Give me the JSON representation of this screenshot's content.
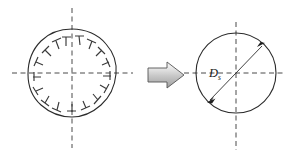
{
  "figure": {
    "background_color": "#ffffff",
    "width": 287,
    "height": 156
  },
  "left_shape": {
    "name": "deformed-hole",
    "description": "Irregular out-of-round hole outline with inward radial hook marks",
    "center": {
      "x": 72,
      "y": 73
    },
    "radius": 44,
    "outline_color": "#2b2b2b",
    "tick_color": "#3a3a3a",
    "tick_count": 14,
    "tick_angles_deg": [
      100,
      78,
      56,
      34,
      12,
      -10,
      -32,
      -54,
      -76,
      -98,
      -120,
      -142,
      -164,
      174
    ],
    "axes": {
      "horizontal": {
        "x1": 12,
        "y1": 73,
        "x2": 133,
        "y2": 73
      },
      "vertical": {
        "x1": 72,
        "y1": 8,
        "x2": 72,
        "y2": 148
      },
      "color": "#4a4a4a",
      "style": "dashed"
    }
  },
  "transform_arrow": {
    "name": "block-arrow",
    "direction": "right",
    "fill_light": "#f2f2f2",
    "fill_mid": "#c9c9c9",
    "fill_dark": "#9a9a9a",
    "outline_color": "#555555",
    "x": 148,
    "y": 62,
    "width": 36,
    "height": 26
  },
  "right_shape": {
    "name": "nominal-hole",
    "description": "Ideal circular hole with diameter dimension",
    "center": {
      "x": 236,
      "y": 73
    },
    "radius": 40,
    "outline_color": "#2b2b2b",
    "axes": {
      "horizontal": {
        "x1": 184,
        "y1": 73,
        "x2": 285,
        "y2": 73
      },
      "vertical": {
        "x1": 236,
        "y1": 22,
        "x2": 236,
        "y2": 150
      },
      "color": "#4a4a4a",
      "style": "dashed"
    },
    "dimension": {
      "label": "D",
      "subscript": "s",
      "label_color": "#1a1a1a",
      "line_color": "#2b2b2b",
      "start": {
        "x": 208,
        "y": 102
      },
      "end": {
        "x": 264,
        "y": 44
      },
      "label_position": {
        "x": 212,
        "y": 74
      },
      "arrowheads": "both-ends"
    }
  }
}
